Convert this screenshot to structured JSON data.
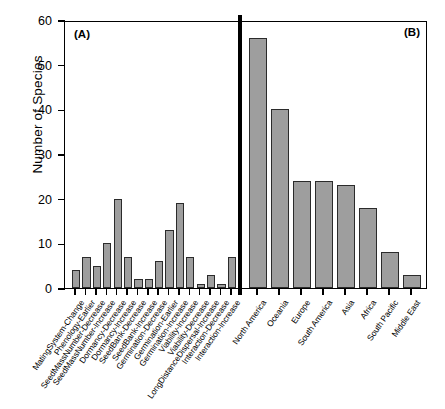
{
  "chart_data": {
    "type": "bar",
    "title": "",
    "xlabel": "",
    "ylabel": "Number of Species",
    "ylim": [
      0,
      60
    ],
    "ytick_labels": [
      "0",
      "10",
      "20",
      "30",
      "40",
      "50",
      "60"
    ],
    "ytick_values": [
      0,
      10,
      20,
      30,
      40,
      50,
      60
    ],
    "grid": false,
    "legend": "none",
    "bar_color": "#9e9e9e",
    "bar_edge_color": "#2b2b2b",
    "panels": [
      {
        "tag": "(A)",
        "categories": [
          "MatingSystem-Change",
          "Phenology-Earlier",
          "SeedMassNumber-Decrease",
          "SeedMassNumber-Increase",
          "Dormancy-Decrease",
          "Dormancy-Increase",
          "SeedBank-Decrease",
          "SeedBank-Increase",
          "Germination-Decrease",
          "Germination-Earlier",
          "Germination-Increase",
          "Viability-Increase",
          "Viability-Decrease",
          "LongDistanceDispersal-Increase",
          "Interaction-Decrease",
          "Interaction-Increase"
        ],
        "values": [
          4,
          7,
          5,
          10,
          20,
          7,
          2,
          2,
          6,
          13,
          19,
          7,
          1,
          3,
          1,
          7
        ]
      },
      {
        "tag": "(B)",
        "categories": [
          "North America",
          "Oceania",
          "Europe",
          "South America",
          "Asia",
          "Africa",
          "South Pacific",
          "Middle East"
        ],
        "values": [
          56,
          40,
          24,
          24,
          23,
          18,
          8,
          3
        ]
      }
    ]
  }
}
